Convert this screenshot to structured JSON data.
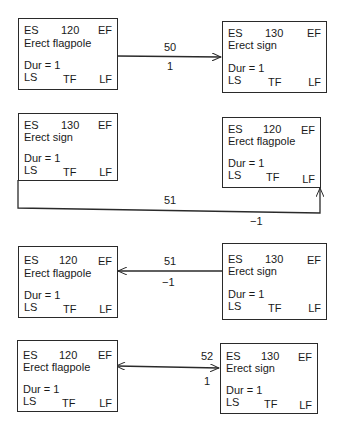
{
  "diagrams": [
    {
      "left": {
        "es": "ES",
        "id": "120",
        "ef": "EF",
        "name": "Erect flagpole",
        "dur": "Dur = 1",
        "ls": "LS",
        "tf": "TF",
        "lf": "LF"
      },
      "right": {
        "es": "ES",
        "id": "130",
        "ef": "EF",
        "name": "Erect sign",
        "dur": "Dur = 1",
        "ls": "LS",
        "tf": "TF",
        "lf": "LF"
      },
      "link": {
        "type": "50",
        "lag": "1",
        "direction": "left-to-right"
      }
    },
    {
      "left": {
        "es": "ES",
        "id": "130",
        "ef": "EF",
        "name": "Erect sign",
        "dur": "Dur = 1",
        "ls": "LS",
        "tf": "TF",
        "lf": "LF"
      },
      "right": {
        "es": "ES",
        "id": "120",
        "ef": "EF",
        "name": "Erect flagpole",
        "dur": "Dur = 1",
        "ls": "LS",
        "tf": "TF",
        "lf": "LF"
      },
      "link": {
        "type": "51",
        "lag": "−1",
        "direction": "left-bottom-to-right-bottom"
      }
    },
    {
      "left": {
        "es": "ES",
        "id": "120",
        "ef": "EF",
        "name": "Erect flagpole",
        "dur": "Dur = 1",
        "ls": "LS",
        "tf": "TF",
        "lf": "LF"
      },
      "right": {
        "es": "ES",
        "id": "130",
        "ef": "EF",
        "name": "Erect sign",
        "dur": "Dur = 1",
        "ls": "LS",
        "tf": "TF",
        "lf": "LF"
      },
      "link": {
        "type": "51",
        "lag": "−1",
        "direction": "right-to-left"
      }
    },
    {
      "left": {
        "es": "ES",
        "id": "120",
        "ef": "EF",
        "name": "Erect flagpole",
        "dur": "Dur = 1",
        "ls": "LS",
        "tf": "TF",
        "lf": "LF"
      },
      "right": {
        "es": "ES",
        "id": "130",
        "ef": "EF",
        "name": "Erect sign",
        "dur": "Dur = 1",
        "ls": "LS",
        "tf": "TF",
        "lf": "LF"
      },
      "link": {
        "type": "52",
        "lag": "1",
        "direction": "bidirectional"
      }
    }
  ]
}
